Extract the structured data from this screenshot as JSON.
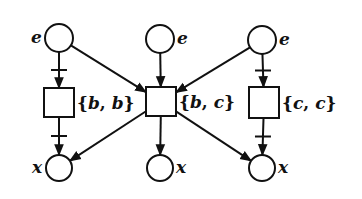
{
  "diagram": {
    "type": "petri-net",
    "colors": {
      "stroke": "#111111",
      "background": "#ffffff"
    },
    "places": [
      {
        "id": "p_top_left",
        "label": "e",
        "cx": 59,
        "cy": 38,
        "r": 14,
        "label_side": "left"
      },
      {
        "id": "p_top_mid",
        "label": "e",
        "cx": 160,
        "cy": 39,
        "r": 14,
        "label_side": "right"
      },
      {
        "id": "p_top_right",
        "label": "e",
        "cx": 262,
        "cy": 40,
        "r": 14,
        "label_side": "right"
      },
      {
        "id": "p_bot_left",
        "label": "x",
        "cx": 59,
        "cy": 168,
        "r": 13,
        "label_side": "left"
      },
      {
        "id": "p_bot_mid",
        "label": "x",
        "cx": 160,
        "cy": 168,
        "r": 13,
        "label_side": "right"
      },
      {
        "id": "p_bot_right",
        "label": "x",
        "cx": 262,
        "cy": 168,
        "r": 13,
        "label_side": "right"
      }
    ],
    "transitions": [
      {
        "id": "t_left",
        "label": "{b, b}",
        "label_parts": [
          "{",
          "b",
          ", ",
          "b",
          "}"
        ],
        "x": 44,
        "y": 88,
        "w": 30,
        "h": 29
      },
      {
        "id": "t_mid",
        "label": "{b, c}",
        "label_parts": [
          "{",
          "b",
          ", ",
          "c",
          "}"
        ],
        "x": 146,
        "y": 87,
        "w": 30,
        "h": 29
      },
      {
        "id": "t_right",
        "label": "{c, c}",
        "label_parts": [
          "{",
          "c",
          ", ",
          "c",
          "}"
        ],
        "x": 249,
        "y": 87,
        "w": 30,
        "h": 31
      }
    ],
    "arcs": [
      {
        "from": "p_top_left",
        "to": "t_left",
        "inhibit_bar": true
      },
      {
        "from": "p_top_left",
        "to": "t_mid",
        "inhibit_bar": false
      },
      {
        "from": "p_top_mid",
        "to": "t_mid",
        "inhibit_bar": false
      },
      {
        "from": "p_top_right",
        "to": "t_mid",
        "inhibit_bar": false
      },
      {
        "from": "p_top_right",
        "to": "t_right",
        "inhibit_bar": true
      },
      {
        "from": "t_left",
        "to": "p_bot_left",
        "inhibit_bar": true
      },
      {
        "from": "t_mid",
        "to": "p_bot_left",
        "inhibit_bar": false
      },
      {
        "from": "t_mid",
        "to": "p_bot_mid",
        "inhibit_bar": false
      },
      {
        "from": "t_mid",
        "to": "p_bot_right",
        "inhibit_bar": false
      },
      {
        "from": "t_right",
        "to": "p_bot_right",
        "inhibit_bar": true
      }
    ]
  }
}
